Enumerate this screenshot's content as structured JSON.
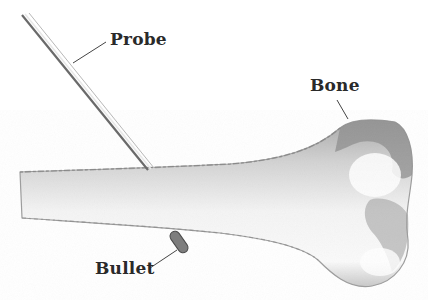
{
  "figure": {
    "type": "anatomical illustration",
    "labels": {
      "probe": "Probe",
      "bone": "Bone",
      "bullet": "Bullet"
    },
    "colors": {
      "background": "#ffffff",
      "ink": "#2a2a2a",
      "bone_shade": "#b8b8b8",
      "bone_dark": "#8a8a8a"
    }
  }
}
